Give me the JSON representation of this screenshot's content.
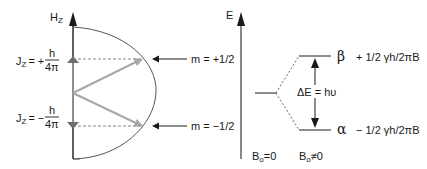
{
  "left_panel": {
    "axis_label_main": "H",
    "axis_label_sub": "Z",
    "upper_state": {
      "label_main": "J",
      "label_sub": "Z",
      "sign": "= +",
      "numerator": "h",
      "denominator": "4π",
      "m_label": "m = +1/2"
    },
    "lower_state": {
      "label_main": "J",
      "label_sub": "Z",
      "sign": "= −",
      "numerator": "h",
      "denominator": "4π",
      "m_label": "m = −1/2"
    }
  },
  "right_panel": {
    "axis_label": "E",
    "upper_level": {
      "symbol": "β",
      "energy": "+ 1/2  γh/2πB"
    },
    "lower_level": {
      "symbol": "α",
      "energy": "− 1/2  γh/2πB"
    },
    "transition_label": "ΔE = hυ",
    "field_off": {
      "main": "B",
      "sub": "o",
      "rel": "=0"
    },
    "field_on": {
      "main": "B",
      "sub": "o",
      "rel": "≠0"
    }
  },
  "colors": {
    "axis": "#1a1a1a",
    "vector": "#a8a8a8",
    "marker": "#6e6e6e",
    "dashed": "#888888",
    "arc": "#555555"
  }
}
